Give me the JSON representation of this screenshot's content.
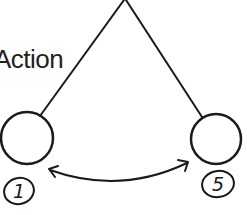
{
  "diagram": {
    "label": "Action",
    "nodes": [
      {
        "id": "left-circle",
        "badge": "1"
      },
      {
        "id": "right-circle",
        "badge": "5"
      }
    ],
    "edges": [
      {
        "from": "apex",
        "to": "left-circle",
        "type": "line"
      },
      {
        "from": "apex",
        "to": "right-circle",
        "type": "line"
      },
      {
        "from": "left-circle",
        "to": "right-circle",
        "type": "double-arrow-curve"
      }
    ],
    "stroke_color": "#1a1a1a"
  }
}
